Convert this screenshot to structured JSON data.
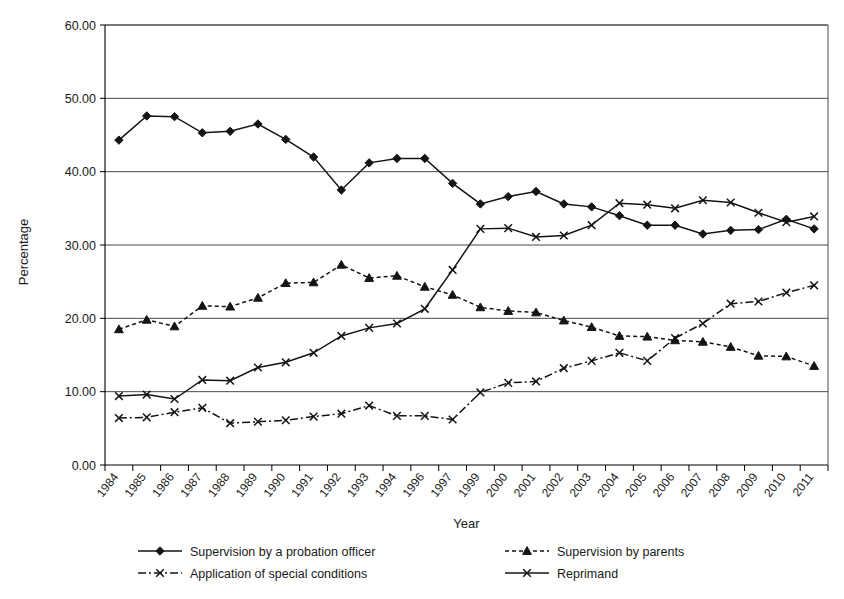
{
  "chart_data": {
    "type": "line",
    "title": "",
    "xlabel": "Year",
    "ylabel": "Percentage",
    "ylim": [
      0,
      60
    ],
    "ytick_step": 10,
    "ytick_labels": [
      "0.00",
      "10.00",
      "20.00",
      "30.00",
      "40.00",
      "50.00",
      "60.00"
    ],
    "grid": true,
    "legend_position": "bottom",
    "categories": [
      "1984",
      "1985",
      "1986",
      "1987",
      "1988",
      "1989",
      "1990",
      "1991",
      "1992",
      "1993",
      "1994",
      "1996",
      "1997",
      "1999",
      "2000",
      "2001",
      "2002",
      "2003",
      "2004",
      "2005",
      "2006",
      "2007",
      "2008",
      "2009",
      "2010",
      "2011"
    ],
    "series": [
      {
        "name": "Supervision by a probation officer",
        "marker": "diamond",
        "dash": "solid",
        "color": "#141414",
        "values": [
          44.3,
          47.6,
          47.5,
          45.3,
          45.5,
          46.5,
          44.4,
          42.0,
          37.5,
          41.2,
          41.8,
          41.8,
          38.4,
          35.6,
          36.6,
          37.3,
          35.6,
          35.2,
          34.0,
          32.7,
          32.7,
          31.5,
          32.0,
          32.1,
          33.5,
          32.2
        ]
      },
      {
        "name": "Supervision by parents",
        "marker": "triangle",
        "dash": "dotted",
        "color": "#141414",
        "values": [
          18.5,
          19.8,
          18.9,
          21.7,
          21.6,
          22.8,
          24.8,
          24.9,
          27.3,
          25.5,
          25.8,
          24.3,
          23.2,
          21.5,
          21.0,
          20.8,
          19.7,
          18.8,
          17.6,
          17.5,
          17.0,
          16.8,
          16.1,
          14.9,
          14.8,
          13.5
        ]
      },
      {
        "name": "Application of special conditions",
        "marker": "x",
        "dash": "dashdot",
        "color": "#141414",
        "values": [
          6.4,
          6.5,
          7.2,
          7.8,
          5.7,
          5.9,
          6.1,
          6.6,
          7.0,
          8.1,
          6.7,
          6.7,
          6.2,
          9.9,
          11.2,
          11.4,
          13.2,
          14.2,
          15.3,
          14.2,
          17.3,
          19.3,
          22.0,
          22.3,
          23.5,
          24.5
        ]
      },
      {
        "name": "Reprimand",
        "marker": "x",
        "dash": "solid",
        "color": "#141414",
        "values": [
          9.4,
          9.6,
          9.0,
          11.6,
          11.5,
          13.3,
          14.0,
          15.3,
          17.6,
          18.7,
          19.3,
          21.3,
          26.6,
          32.2,
          32.3,
          31.1,
          31.3,
          32.7,
          35.7,
          35.5,
          35.0,
          36.1,
          35.8,
          34.4,
          33.1,
          33.9
        ]
      }
    ],
    "series_order_in_data": [
      "Supervision by a probation officer",
      "Supervision by parents",
      "Application of special conditions",
      "Reprimand"
    ]
  },
  "legend": {
    "items": [
      {
        "label": "Supervision by a probation officer",
        "marker": "diamond",
        "dash": "solid"
      },
      {
        "label": "Supervision by parents",
        "marker": "triangle",
        "dash": "dotted"
      },
      {
        "label": "Application of special conditions",
        "marker": "x",
        "dash": "dashdot"
      },
      {
        "label": "Reprimand",
        "marker": "x",
        "dash": "solid"
      }
    ]
  }
}
